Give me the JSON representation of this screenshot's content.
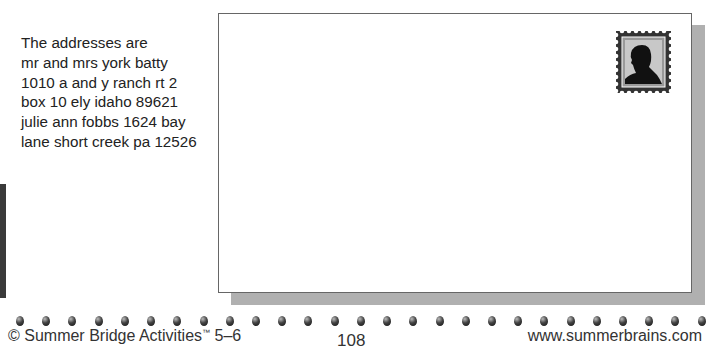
{
  "addresses": {
    "lines": [
      "The addresses are",
      "mr and mrs york batty",
      "1010 a and y ranch rt 2",
      "box 10 ely idaho 89621",
      "julie ann fobbs 1624 bay",
      "lane short creek pa 12526"
    ]
  },
  "envelope": {
    "stamp_icon": "postage-stamp-silhouette-icon"
  },
  "footer": {
    "copyright": "© Summer Bridge Activities",
    "trademark": "™",
    "grade": " 5–6",
    "page_number": "108",
    "website": "www.summerbrains.com"
  },
  "decor": {
    "dot_count": 27
  }
}
